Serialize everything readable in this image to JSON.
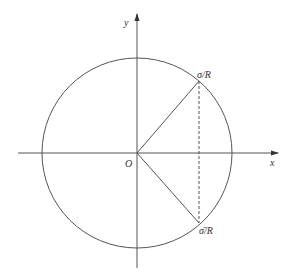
{
  "diagram": {
    "axes": {
      "x_label": "x",
      "y_label": "y",
      "origin_label": "O"
    },
    "points": {
      "upper_label": "σ/R",
      "lower_label": "σ̄/R"
    },
    "colors": {
      "line": "#555555",
      "background": "#ffffff"
    }
  }
}
